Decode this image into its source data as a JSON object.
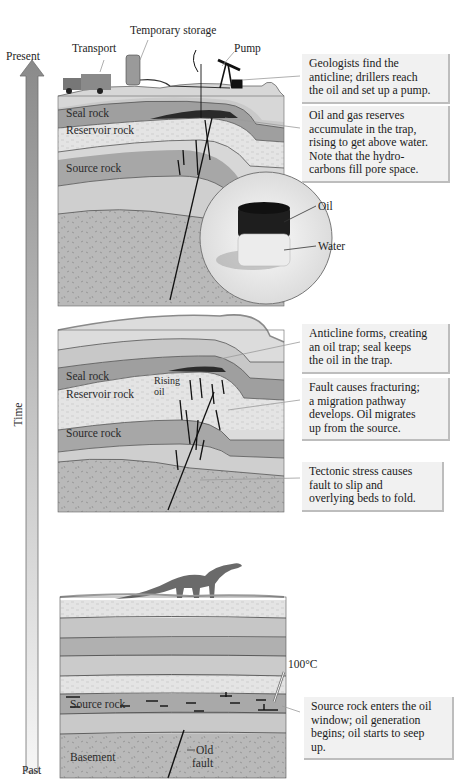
{
  "timeline": {
    "top_label": "Present",
    "axis_label": "Time",
    "bottom_label": "Past",
    "arrow_color_top": "#8a8a8a",
    "arrow_color_bottom": "#f4f4f4"
  },
  "panels": [
    {
      "id": "present",
      "surface_labels": {
        "transport": "Transport",
        "storage": "Temporary storage",
        "pump": "Pump"
      },
      "rock_labels": {
        "seal": "Seal rock",
        "reservoir": "Reservoir rock",
        "source": "Source rock"
      },
      "inset_labels": {
        "oil": "Oil",
        "water": "Water"
      },
      "callouts": [
        {
          "lines": [
            "Geologists find the",
            "anticline; drillers reach",
            "the oil and set up a pump."
          ]
        },
        {
          "lines": [
            "Oil and gas reserves",
            "accumulate in the trap,",
            "rising to get above water.",
            "Note that the hydro-",
            "carbons fill pore space."
          ]
        }
      ]
    },
    {
      "id": "middle",
      "rock_labels": {
        "seal": "Seal rock",
        "rising_oil_1": "Rising",
        "rising_oil_2": "oil",
        "reservoir": "Reservoir rock",
        "source": "Source rock"
      },
      "callouts": [
        {
          "lines": [
            "Anticline forms, creating",
            "an oil trap; seal keeps",
            "the oil in the trap."
          ]
        },
        {
          "lines": [
            "Fault causes fracturing;",
            "a migration pathway",
            "develops. Oil migrates",
            "up from the source."
          ]
        },
        {
          "lines": [
            "Tectonic stress causes",
            "fault to slip and",
            "overlying beds to fold."
          ]
        }
      ]
    },
    {
      "id": "past",
      "rock_labels": {
        "source": "Source rock",
        "basement": "Basement",
        "old_fault_1": "Old",
        "old_fault_2": "fault",
        "temperature": "100°C"
      },
      "callouts": [
        {
          "lines": [
            "Source rock enters the oil",
            "window; oil generation",
            "begins; oil starts to seep",
            "up."
          ]
        }
      ]
    }
  ]
}
